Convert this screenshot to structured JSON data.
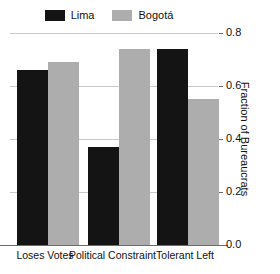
{
  "chart_data": {
    "type": "bar",
    "title": "",
    "subtitle": "",
    "xlabel": "",
    "ylabel": "Fraction of Bureaucrats",
    "categories": [
      "Loses Votes",
      "Political Constraint",
      "Tolerant Left"
    ],
    "series": [
      {
        "name": "Lima",
        "color": "#141414",
        "values": [
          0.66,
          0.37,
          0.74
        ]
      },
      {
        "name": "Bogotá",
        "color": "#adadad",
        "values": [
          0.69,
          0.74,
          0.55
        ]
      }
    ],
    "ylim": [
      0.0,
      0.8
    ],
    "ytick_labels": [
      "0.0",
      "0.2",
      "0.4",
      "0.6",
      "0.8"
    ],
    "ytick_values": [
      0.0,
      0.2,
      0.4,
      0.6,
      0.8
    ],
    "grid": "horizontal",
    "y_axis_position": "right",
    "legend_position": "top-center",
    "legend_entries": [
      "Lima",
      "Bogotá"
    ]
  },
  "legend": {
    "lima_label": "Lima",
    "bogota_label": "Bogotá",
    "lima_swatch_color": "#141414",
    "bogota_swatch_color": "#adadad"
  },
  "axis": {
    "y_title": "Fraction of Bureaucrats",
    "y_tick_0": "0.0",
    "y_tick_1": "0.2",
    "y_tick_2": "0.4",
    "y_tick_3": "0.6",
    "y_tick_4": "0.8",
    "x_cat_0": "Loses Votes",
    "x_cat_1": "Political Constraint",
    "x_cat_2": "Tolerant Left"
  }
}
